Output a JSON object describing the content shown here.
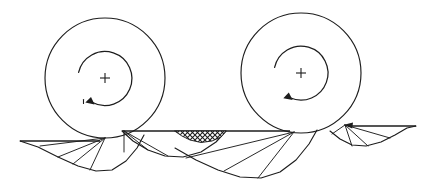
{
  "figure": {
    "type": "technical-line-diagram",
    "background_color": "#ffffff",
    "ink_color": "#1d1d1d",
    "canvas": {
      "width": 425,
      "height": 183
    }
  },
  "wheels": [
    {
      "id": "left-wheel",
      "label": "Left rolling wheel",
      "center_x": 105,
      "center_y": 78,
      "radius": 60,
      "center_marker": "plus-cross",
      "center_marker_size": 9,
      "rotation": "clockwise",
      "rotation_arrow": {
        "radius": 27,
        "start_angle_deg": 168,
        "end_angle_deg": 466,
        "arrowhead_at": "end"
      },
      "ground_contact_x": 105,
      "ground_contact_y": 138
    },
    {
      "id": "right-wheel",
      "label": "Right rolling wheel",
      "center_x": 301,
      "center_y": 73,
      "radius": 60,
      "center_marker": "plus-cross",
      "center_marker_size": 9,
      "rotation": "clockwise",
      "rotation_arrow": {
        "radius": 27,
        "start_angle_deg": 168,
        "end_angle_deg": 466,
        "arrowhead_at": "end"
      },
      "ground_contact_x": 294,
      "ground_contact_y": 132
    }
  ],
  "ground_lines": [
    {
      "id": "ground-left",
      "label": "Left ground segment",
      "x1": 20,
      "y1": 141,
      "x2": 100,
      "y2": 141
    },
    {
      "id": "ground-middle",
      "label": "Middle ground segment",
      "x1": 122,
      "y1": 131,
      "x2": 290,
      "y2": 131
    },
    {
      "id": "ground-right",
      "label": "Right ground segment",
      "x1": 348,
      "y1": 126,
      "x2": 416,
      "y2": 126
    }
  ],
  "cycloid_arcs": [
    {
      "id": "cycloid-left-outer",
      "label": "Left outer cycloid trace",
      "points": "20,141 38,147 58,157 78,166 96,171 112,170 126,161 137,148 144,135"
    },
    {
      "id": "cycloid-mid-left",
      "label": "Middle-left cycloid trace",
      "points": "122,131 133,141 148,150 165,156 183,157 201,152 216,142 226,131"
    },
    {
      "id": "cycloid-mid-right",
      "label": "Middle-right cycloid trace",
      "points": "175,148 196,160 218,170 240,177 261,178 280,172 296,160 309,144 317,130"
    },
    {
      "id": "cycloid-right-outer",
      "label": "Right outer cycloid trace",
      "points": "330,131 340,139 352,145 366,146 381,142 395,135 407,128 416,126"
    }
  ],
  "radial_spokes": [
    {
      "id": "spoke-l1",
      "label": "Left spoke 1",
      "x1": 105,
      "y1": 138,
      "x2": 40,
      "y2": 146
    },
    {
      "id": "spoke-l2",
      "label": "Left spoke 2",
      "x1": 105,
      "y1": 138,
      "x2": 58,
      "y2": 157
    },
    {
      "id": "spoke-l3",
      "label": "Left spoke 3",
      "x1": 105,
      "y1": 138,
      "x2": 73,
      "y2": 164
    },
    {
      "id": "spoke-l4",
      "label": "Left spoke 4",
      "x1": 105,
      "y1": 138,
      "x2": 90,
      "y2": 170
    },
    {
      "id": "spoke-m1",
      "label": "Middle vertical spoke",
      "x1": 124,
      "y1": 131,
      "x2": 124,
      "y2": 152
    },
    {
      "id": "spoke-m2",
      "label": "Middle spoke 2",
      "x1": 124,
      "y1": 131,
      "x2": 148,
      "y2": 150
    },
    {
      "id": "spoke-m3",
      "label": "Middle spoke 3",
      "x1": 124,
      "y1": 131,
      "x2": 168,
      "y2": 156
    },
    {
      "id": "spoke-r1",
      "label": "Right spoke 1",
      "x1": 294,
      "y1": 132,
      "x2": 186,
      "y2": 158
    },
    {
      "id": "spoke-r2",
      "label": "Right spoke 2",
      "x1": 294,
      "y1": 132,
      "x2": 224,
      "y2": 171
    },
    {
      "id": "spoke-r3",
      "label": "Right spoke 3",
      "x1": 294,
      "y1": 132,
      "x2": 258,
      "y2": 178
    },
    {
      "id": "spoke-f1",
      "label": "Far-right spoke 1",
      "x1": 345,
      "y1": 125,
      "x2": 352,
      "y2": 146
    },
    {
      "id": "spoke-f2",
      "label": "Far-right spoke 2",
      "x1": 345,
      "y1": 125,
      "x2": 368,
      "y2": 146
    },
    {
      "id": "spoke-f3",
      "label": "Far-right spoke 3",
      "x1": 345,
      "y1": 125,
      "x2": 390,
      "y2": 138
    },
    {
      "id": "spoke-f4",
      "label": "Far-right spoke 4",
      "x1": 345,
      "y1": 125,
      "x2": 332,
      "y2": 134
    }
  ],
  "hatched_region": {
    "id": "crosshatched-wedge",
    "label": "Crosshatched contact wedge",
    "pattern": "cross-hatch-diamond",
    "pattern_color": "#1d1d1d",
    "top_left_x": 175,
    "top_right_x": 226,
    "top_y": 131,
    "apex_x": 201,
    "apex_y": 142,
    "outline": "175,131 226,131 220,137 210,141 201,142 191,140 182,136"
  },
  "notes": {
    "rotation_sense": "clockwise",
    "trace_type": "cycloid / trochoid",
    "contact_points": 2
  }
}
